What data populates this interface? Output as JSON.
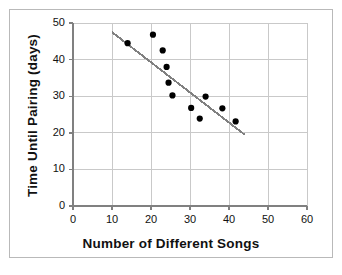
{
  "chart_data": {
    "type": "scatter",
    "title": "",
    "xlabel": "Number of Different Songs",
    "ylabel": "Time Until Pairing (days)",
    "xlim": [
      0,
      60
    ],
    "ylim": [
      0,
      50
    ],
    "xticks": [
      0,
      10,
      20,
      30,
      40,
      50,
      60
    ],
    "yticks": [
      0,
      10,
      20,
      30,
      40,
      50
    ],
    "grid": true,
    "legend": "none",
    "points": [
      {
        "x": 14,
        "y": 44.5
      },
      {
        "x": 20.5,
        "y": 46.8
      },
      {
        "x": 23,
        "y": 42.5
      },
      {
        "x": 24,
        "y": 38
      },
      {
        "x": 24.5,
        "y": 33.7
      },
      {
        "x": 25.5,
        "y": 30.2
      },
      {
        "x": 30.3,
        "y": 26.8
      },
      {
        "x": 32.5,
        "y": 23.9
      },
      {
        "x": 34,
        "y": 29.9
      },
      {
        "x": 38.3,
        "y": 26.7
      },
      {
        "x": 41.7,
        "y": 23.1
      }
    ],
    "trend_line": {
      "x1": 10,
      "y1": 47.5,
      "x2": 44,
      "y2": 19.5
    },
    "colors": {
      "point": "#000000",
      "trend_line": "#808080",
      "grid": "#c9c9c9",
      "axis": "#808080",
      "frame": "#b9b9b9",
      "background": "#ffffff",
      "text": "#111111"
    }
  },
  "axes": {
    "x_tick_labels": [
      "0",
      "10",
      "20",
      "30",
      "40",
      "50",
      "60"
    ],
    "y_tick_labels": [
      "0",
      "10",
      "20",
      "30",
      "40",
      "50"
    ]
  }
}
